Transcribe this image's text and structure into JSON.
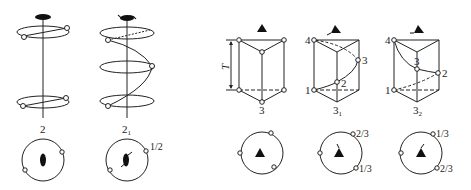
{
  "diagram": {
    "type": "symmetry-axes-illustration",
    "colors": {
      "stroke": "#222222",
      "fill": "#111111",
      "background": "#ffffff"
    },
    "panels": [
      {
        "id": "axis-2",
        "label": "2",
        "label_sub": "",
        "kind": "two-fold rotation axis",
        "stereogram_labels": []
      },
      {
        "id": "axis-2-1",
        "label": "2",
        "label_sub": "1",
        "kind": "two-fold screw axis",
        "stereogram_labels": [
          "1/2"
        ]
      },
      {
        "id": "axis-3",
        "label": "3",
        "label_sub": "",
        "kind": "three-fold rotation axis",
        "period_label": "T",
        "vertex_labels": [],
        "stereogram_labels": []
      },
      {
        "id": "axis-3-1",
        "label": "3",
        "label_sub": "1",
        "kind": "three-fold screw axis (right-handed)",
        "vertex_labels": [
          "4",
          "3",
          "2",
          "1"
        ],
        "stereogram_labels": [
          "2/3",
          "1/3"
        ]
      },
      {
        "id": "axis-3-2",
        "label": "3",
        "label_sub": "2",
        "kind": "three-fold screw axis (left-handed)",
        "vertex_labels": [
          "4",
          "3",
          "2",
          "1"
        ],
        "stereogram_labels": [
          "1/3",
          "2/3"
        ]
      }
    ]
  }
}
